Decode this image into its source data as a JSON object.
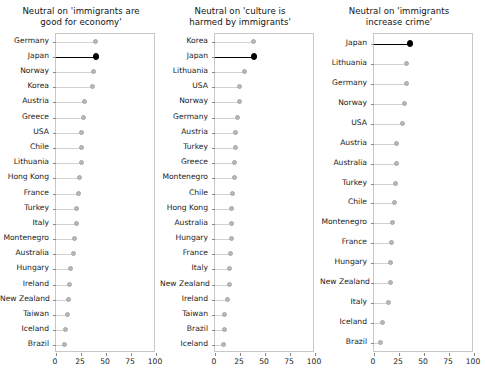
{
  "figure": {
    "width": 485,
    "height": 382,
    "background": "#ffffff",
    "highlight_color": "#000000",
    "point_color": "#b8b8b8",
    "axis_color": "#c8c8c8"
  },
  "chart_data": [
    {
      "type": "scatter",
      "title": "Neutral on 'immigrants are\ngood for economy'",
      "xlabel": "",
      "ylabel": "",
      "xlim": [
        0,
        100
      ],
      "xticks": [
        0,
        25,
        50,
        75,
        100
      ],
      "xticklabels": [
        "0",
        "25",
        "50",
        "75",
        "100"
      ],
      "grid": false,
      "highlight": "Japan",
      "categories": [
        "Germany",
        "Japan",
        "Norway",
        "Korea",
        "Austria",
        "Greece",
        "USA",
        "Chile",
        "Lithuania",
        "Hong Kong",
        "France",
        "Turkey",
        "Italy",
        "Montenegro",
        "Australia",
        "Hungary",
        "Ireland",
        "New Zealand",
        "Taiwan",
        "Iceland",
        "Brazil"
      ],
      "values": [
        39,
        40,
        37,
        36,
        28,
        27,
        25,
        25,
        25,
        23,
        22,
        20,
        20,
        18,
        17,
        14,
        13,
        12,
        11,
        9,
        8
      ]
    },
    {
      "type": "scatter",
      "title": "Neutral on 'culture is\nharmed by immigrants'",
      "xlabel": "",
      "ylabel": "",
      "xlim": [
        0,
        100
      ],
      "xticks": [
        0,
        25,
        50,
        75,
        100
      ],
      "xticklabels": [
        "0",
        "25",
        "50",
        "75",
        "100"
      ],
      "grid": false,
      "highlight": "Japan",
      "categories": [
        "Korea",
        "Japan",
        "Lithuania",
        "USA",
        "Norway",
        "Germany",
        "Austria",
        "Turkey",
        "Greece",
        "Montenegro",
        "Chile",
        "Hong Kong",
        "Australia",
        "Hungary",
        "France",
        "Italy",
        "New Zealand",
        "Ireland",
        "Taiwan",
        "Brazil",
        "Iceland"
      ],
      "values": [
        38,
        39,
        29,
        24,
        24,
        22,
        20,
        20,
        19,
        19,
        17,
        16,
        16,
        16,
        15,
        14,
        14,
        12,
        9,
        9,
        8
      ]
    },
    {
      "type": "scatter",
      "title": "Neutral on 'immigrants\nincrease crime'",
      "xlabel": "",
      "ylabel": "",
      "xlim": [
        0,
        100
      ],
      "xticks": [
        0,
        25,
        50,
        75,
        100
      ],
      "xticklabels": [
        "0",
        "25",
        "50",
        "75",
        "100"
      ],
      "grid": false,
      "highlight": "Japan",
      "categories": [
        "Japan",
        "Lithuania",
        "Germany",
        "Norway",
        "USA",
        "Austria",
        "Australia",
        "Turkey",
        "Chile",
        "Montenegro",
        "France",
        "Hungary",
        "New Zealand",
        "Italy",
        "Iceland",
        "Brazil"
      ],
      "values": [
        36,
        32,
        32,
        30,
        28,
        22,
        22,
        21,
        20,
        18,
        17,
        16,
        16,
        14,
        8,
        6
      ]
    }
  ]
}
